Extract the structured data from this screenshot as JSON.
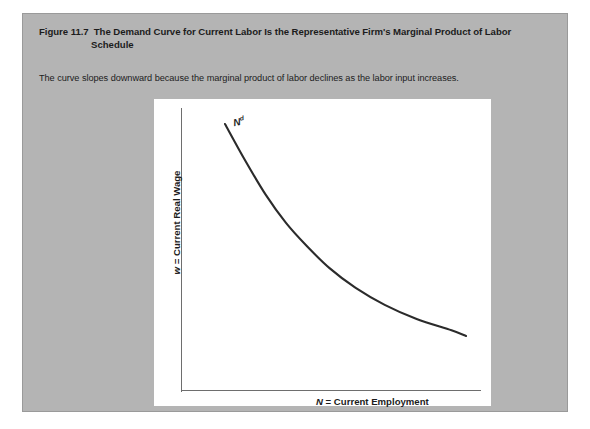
{
  "figure": {
    "number_label": "Figure 11.7",
    "title_line1": "The Demand Curve for Current Labor Is the Representative Firm's Marginal Product of Labor",
    "title_line2": "Schedule",
    "caption": "The curve slopes downward because the marginal product of labor declines as the labor input increases.",
    "card_color": "#b4b4b4",
    "panel_color": "#ffffff"
  },
  "chart_data": {
    "type": "line",
    "title": "The Demand Curve for Current Labor Is the Representative Firm's Marginal Product of Labor Schedule",
    "xlabel_prefix": "N",
    "xlabel_rest": " = Current Employment",
    "ylabel_prefix": "w",
    "ylabel_rest": " = Current Real Wage",
    "xlabel": "N = Current Employment",
    "ylabel": "w = Current Real Wage",
    "series": [
      {
        "name": "Nd",
        "label_base": "N",
        "label_sup": "d",
        "color": "#2b2b2b",
        "x": [
          0.17,
          0.24,
          0.31,
          0.38,
          0.45,
          0.53,
          0.62,
          0.72,
          0.83,
          0.95,
          1.0
        ],
        "y": [
          0.97,
          0.84,
          0.72,
          0.62,
          0.54,
          0.46,
          0.39,
          0.33,
          0.28,
          0.24,
          0.22
        ]
      }
    ],
    "grid": false,
    "legend": "none",
    "xlim": [
      0,
      1
    ],
    "ylim": [
      0,
      1
    ],
    "axis_ticks": "none",
    "axis_color": "#6e6e6e"
  }
}
